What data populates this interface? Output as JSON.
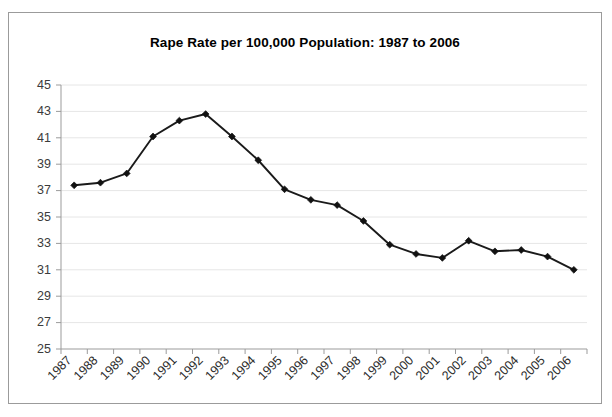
{
  "chart_data": {
    "type": "line",
    "title": "Rape Rate per 100,000 Population: 1987 to 2006",
    "xlabel": "",
    "ylabel": "",
    "categories": [
      "1987",
      "1988",
      "1989",
      "1990",
      "1991",
      "1992",
      "1993",
      "1994",
      "1995",
      "1996",
      "1997",
      "1998",
      "1999",
      "2000",
      "2001",
      "2002",
      "2003",
      "2004",
      "2005",
      "2006"
    ],
    "values": [
      37.4,
      37.6,
      38.3,
      41.1,
      42.3,
      42.8,
      41.1,
      39.3,
      37.1,
      36.3,
      35.9,
      34.7,
      32.9,
      32.2,
      31.9,
      33.2,
      32.4,
      32.5,
      32.0,
      31.0
    ],
    "ylim": [
      25,
      45
    ],
    "ytick_labels": [
      "25",
      "27",
      "29",
      "31",
      "33",
      "35",
      "37",
      "39",
      "41",
      "43",
      "45"
    ],
    "ytick_step": 2,
    "grid": "horizontal",
    "legend": "none",
    "marker": "diamond",
    "line_color": "#1a1a1a",
    "grid_color": "#e6e6e6",
    "axis_color": "#9b9b9b",
    "xtick_rotation_degrees": 45
  }
}
